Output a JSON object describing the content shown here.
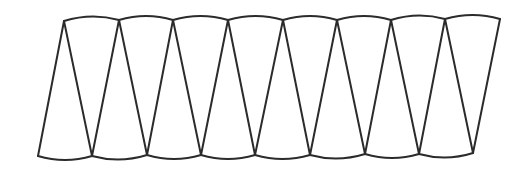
{
  "diagram": {
    "stroke_color": "#2b2b2b",
    "background_color": "#ffffff",
    "stroke_width": 2,
    "top_vertices": [
      [
        64,
        21
      ],
      [
        119,
        20
      ],
      [
        173,
        20
      ],
      [
        228,
        20
      ],
      [
        283,
        20
      ],
      [
        337,
        20
      ],
      [
        391,
        20
      ],
      [
        445,
        19
      ],
      [
        500,
        19
      ]
    ],
    "bottom_vertices": [
      [
        38,
        156
      ],
      [
        92,
        156
      ],
      [
        147,
        155
      ],
      [
        201,
        155
      ],
      [
        255,
        155
      ],
      [
        310,
        155
      ],
      [
        365,
        154
      ],
      [
        419,
        154
      ],
      [
        473,
        153
      ]
    ],
    "top_arc_bulge": -4,
    "bottom_arc_bulge": 4,
    "segment_count": 8
  }
}
